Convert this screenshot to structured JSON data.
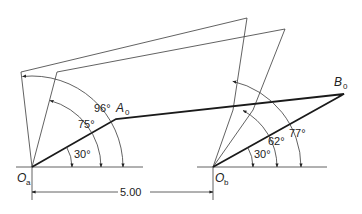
{
  "figure": {
    "points": {
      "Oa": {
        "label": "O",
        "sub": "a"
      },
      "Ob": {
        "label": "O",
        "sub": "b"
      },
      "A0": {
        "label": "A",
        "sub": "0"
      },
      "B0": {
        "label": "B",
        "sub": "0"
      }
    },
    "angles_a": [
      "30°",
      "75°",
      "96°"
    ],
    "angles_b": [
      "30°",
      "62°",
      "77°"
    ],
    "dimension": "5.00"
  }
}
